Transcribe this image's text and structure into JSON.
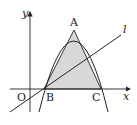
{
  "diagram": {
    "labels": {
      "y_axis": "y",
      "x_axis": "x",
      "origin": "O",
      "A": "A",
      "B": "B",
      "C": "C",
      "line": "l"
    },
    "colors": {
      "stroke": "#222222",
      "shade": "#d8d8d8",
      "background": "#ffffff"
    }
  }
}
